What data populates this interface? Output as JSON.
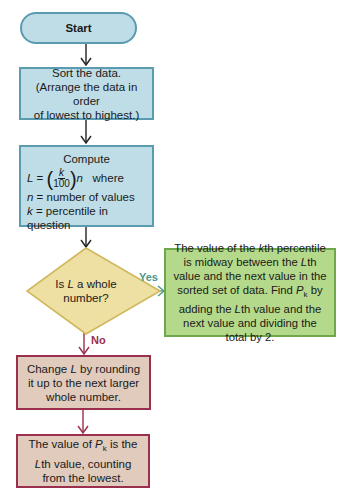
{
  "diagram": {
    "colors": {
      "process_fill": "#bfdde6",
      "process_border": "#5a9bb0",
      "decision_fill": "#eedfa2",
      "decision_border": "#d0b85e",
      "yes_fill": "#b5d98a",
      "yes_border": "#6ea84a",
      "no_fill": "#e0cbbd",
      "no_border": "#9b2f4e",
      "yes_label": "#4a9a8a",
      "no_label": "#9b2f4e"
    },
    "nodes": {
      "start": {
        "label": "Start"
      },
      "sort": {
        "line1": "Sort the data.",
        "line2": "(Arrange the data in order",
        "line3": "of lowest to highest.)"
      },
      "compute": {
        "heading": "Compute",
        "formula_lhs": "L",
        "formula_eq": "=",
        "formula_num": "k",
        "formula_den": "100",
        "formula_var": "n",
        "formula_where": "where",
        "def_n_var": "n",
        "def_n_text": "= number of values",
        "def_k_var": "k",
        "def_k_text": "= percentile in question"
      },
      "decision": {
        "pre": "Is ",
        "var": "L",
        "post": " a whole",
        "line2": "number?"
      },
      "yes_result": {
        "t1": "The value of the ",
        "k": "k",
        "t2": "th percentile is midway between the ",
        "L1": "L",
        "t3": "th value and the next value in the sorted set of data. Find ",
        "P": "P",
        "sub": "k",
        "t4": " by adding the ",
        "L2": "L",
        "t5": "th value and the next value and dividing the total by 2."
      },
      "round_up": {
        "t1": "Change ",
        "L": "L",
        "t2": " by rounding it up to the next larger whole number."
      },
      "no_result": {
        "t1": "The value of ",
        "P": "P",
        "sub": "k",
        "t2": " is the ",
        "L": "L",
        "t3": "th value, counting from the lowest."
      }
    },
    "edges": {
      "yes_label": "Yes",
      "no_label": "No"
    }
  }
}
